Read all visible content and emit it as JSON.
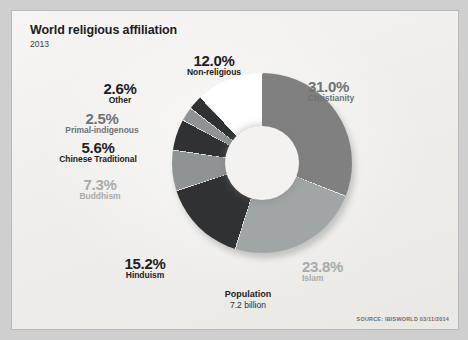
{
  "header": {
    "title": "World religious affiliation",
    "year": "2013"
  },
  "center": {
    "caption_title": "Population",
    "caption_value": "7.2 billion"
  },
  "footer": {
    "source": "SOURCE: IBISWORLD 03/11/2014"
  },
  "labels": {
    "non_religious": {
      "pct": "12.0%",
      "name": "Non-religious"
    },
    "other": {
      "pct": "2.6%",
      "name": "Other"
    },
    "primal": {
      "pct": "2.5%",
      "name": "Primal-indigenous"
    },
    "chinese": {
      "pct": "5.6%",
      "name": "Chinese Traditional"
    },
    "buddhism": {
      "pct": "7.3%",
      "name": "Buddhism"
    },
    "hinduism": {
      "pct": "15.2%",
      "name": "Hinduism"
    },
    "christianity": {
      "pct": "31.0%",
      "name": "Christianity"
    },
    "islam": {
      "pct": "23.8%",
      "name": "Islam"
    }
  },
  "colors": {
    "card_bg": "#f2f1ef",
    "page_bg": "#cfcfcf",
    "text_dark": "#1d2023",
    "text_mid": "#6e7375",
    "text_light": "#a7abac",
    "segment_mid_gray": "#808080",
    "segment_light_gray": "#a0a5a5",
    "segment_pale_gray": "#8e9394",
    "segment_charcoal": "#2f3132",
    "segment_white": "#ffffff"
  },
  "chart_data": {
    "type": "pie",
    "title": "World religious affiliation",
    "subtitle": "2013",
    "donut": true,
    "hole_ratio": 0.41,
    "start_angle_deg": 0,
    "direction": "clockwise",
    "total_label": "Population",
    "total_value": "7.2 billion",
    "legend": "outside-labels",
    "grid": false,
    "xlabel": "",
    "ylabel": "",
    "categories": [
      "Christianity",
      "Islam",
      "Hinduism",
      "Buddhism",
      "Chinese Traditional",
      "Primal-indigenous",
      "Other",
      "Non-religious"
    ],
    "values": [
      31.0,
      23.8,
      15.2,
      7.3,
      5.6,
      2.5,
      2.6,
      12.0
    ],
    "slice_colors": [
      "#808080",
      "#a0a5a5",
      "#2f3132",
      "#8e9394",
      "#2f3132",
      "#8e9394",
      "#2f3132",
      "#ffffff"
    ],
    "units": "percent"
  }
}
